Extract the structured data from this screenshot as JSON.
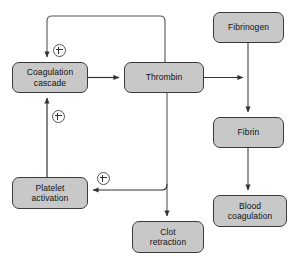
{
  "diagram": {
    "style": {
      "node_fill": "#c8c8c8",
      "node_stroke": "#3a3a3a",
      "edge_stroke": "#333333",
      "background": "#ffffff",
      "badge_fill": "#ffffff"
    },
    "nodes": [
      {
        "id": "coagulation-cascade",
        "label": "Coagulation\ncascade",
        "x": 12,
        "y": 62,
        "width": 76,
        "height": 31
      },
      {
        "id": "thrombin",
        "label": "Thrombin",
        "x": 124,
        "y": 62,
        "width": 80,
        "height": 31
      },
      {
        "id": "fibrinogen",
        "label": "Fibrinogen",
        "x": 213,
        "y": 12,
        "width": 71,
        "height": 31
      },
      {
        "id": "fibrin",
        "label": "Fibrin",
        "x": 213,
        "y": 117,
        "width": 71,
        "height": 31
      },
      {
        "id": "blood-coagulation",
        "label": "Blood\ncoagulation",
        "x": 213,
        "y": 195,
        "width": 74,
        "height": 32
      },
      {
        "id": "platelet-activation",
        "label": "Platelet\nactivation",
        "x": 12,
        "y": 177,
        "width": 76,
        "height": 32
      },
      {
        "id": "clot-retraction",
        "label": "Clot\nretraction",
        "x": 132,
        "y": 221,
        "width": 72,
        "height": 32
      }
    ],
    "badges": [
      {
        "id": "plus-thrombin-feedback",
        "symbol": "+",
        "x": 53,
        "y": 44
      },
      {
        "id": "plus-platelet-feedback",
        "symbol": "+",
        "x": 52,
        "y": 110
      },
      {
        "id": "plus-thrombin-platelet",
        "symbol": "+",
        "x": 97,
        "y": 172
      }
    ],
    "edges": [
      {
        "id": "cascade-to-thrombin",
        "from": "coagulation-cascade",
        "to": "thrombin",
        "sign": null
      },
      {
        "id": "thrombin-to-cascade-feedback",
        "from": "thrombin",
        "to": "coagulation-cascade",
        "sign": "+"
      },
      {
        "id": "thrombin-to-fibrinogen-conversion",
        "from": "thrombin",
        "to": "fibrinogen-fibrin-axis",
        "sign": null
      },
      {
        "id": "fibrinogen-to-fibrin",
        "from": "fibrinogen",
        "to": "fibrin",
        "sign": null
      },
      {
        "id": "fibrin-to-blood-coagulation",
        "from": "fibrin",
        "to": "blood-coagulation",
        "sign": null
      },
      {
        "id": "thrombin-to-platelet-activation",
        "from": "thrombin",
        "to": "platelet-activation",
        "sign": "+"
      },
      {
        "id": "thrombin-to-clot-retraction",
        "from": "thrombin",
        "to": "clot-retraction",
        "sign": null
      },
      {
        "id": "platelet-activation-to-cascade",
        "from": "platelet-activation",
        "to": "coagulation-cascade",
        "sign": "+"
      }
    ]
  }
}
